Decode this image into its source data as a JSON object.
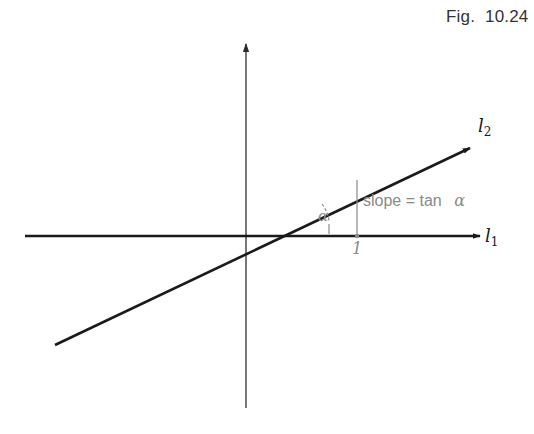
{
  "figure": {
    "label": "Fig.  10.24"
  },
  "axes": {
    "horizontal_label": "l",
    "horizontal_subscript": "1",
    "tick_label": "1"
  },
  "line": {
    "label": "l",
    "label_subscript": "2"
  },
  "annotations": {
    "angle_label": "α",
    "slope_text": "slope = tan",
    "slope_symbol": "α"
  },
  "colors": {
    "axis": "#1a1a1a",
    "line": "#1a1a1a",
    "annotation": "#8a8a8a",
    "text": "#333333"
  }
}
